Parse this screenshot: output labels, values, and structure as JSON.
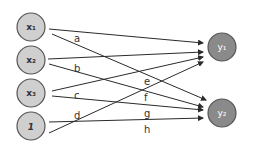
{
  "diagram": {
    "type": "neural-network",
    "input_nodes": [
      {
        "id": "x1",
        "label": "x₁",
        "cx": 31,
        "cy": 27
      },
      {
        "id": "x2",
        "label": "x₂",
        "cx": 31,
        "cy": 60
      },
      {
        "id": "x3",
        "label": "x₃",
        "cx": 31,
        "cy": 93
      },
      {
        "id": "bias",
        "label": "1",
        "cx": 31,
        "cy": 126
      }
    ],
    "output_nodes": [
      {
        "id": "y1",
        "label": "y₁",
        "cx": 222,
        "cy": 47
      },
      {
        "id": "y2",
        "label": "y₂",
        "cx": 222,
        "cy": 113
      }
    ],
    "edges": [
      {
        "from": "x1",
        "to": "y1",
        "weight": "a"
      },
      {
        "from": "x2",
        "to": "y1",
        "weight": "b"
      },
      {
        "from": "x3",
        "to": "y1",
        "weight": "c"
      },
      {
        "from": "bias",
        "to": "y1",
        "weight": "d"
      },
      {
        "from": "x1",
        "to": "y2",
        "weight": "e"
      },
      {
        "from": "x2",
        "to": "y2",
        "weight": "f"
      },
      {
        "from": "x3",
        "to": "y2",
        "weight": "g"
      },
      {
        "from": "bias",
        "to": "y2",
        "weight": "h"
      }
    ],
    "edge_labels": {
      "a": "a",
      "b": "b",
      "c": "c",
      "d": "d",
      "e": "e",
      "f": "f",
      "g": "g",
      "h": "h"
    },
    "colors": {
      "input_fill": "#cfcfcf",
      "output_fill": "#8a8a8a",
      "stroke": "#555555",
      "edge": "#2a2a2a"
    }
  }
}
